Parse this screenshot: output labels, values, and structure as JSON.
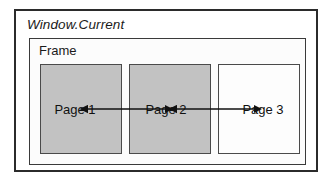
{
  "diagram": {
    "window": {
      "title": "Window.Current",
      "title_style": "italic",
      "border_color": "#2b2b2b",
      "fill_color": "#ffffff"
    },
    "frame": {
      "title": "Frame",
      "border_color": "#3a3a3a",
      "fill_color": "#fcfcfc"
    },
    "pages": [
      {
        "label": "Page 1",
        "fill": "gray",
        "fill_color": "#c2c2c2",
        "border_color": "#4a4a4a"
      },
      {
        "label": "Page 2",
        "fill": "gray",
        "fill_color": "#c2c2c2",
        "border_color": "#4a4a4a"
      },
      {
        "label": "Page 3",
        "fill": "white",
        "fill_color": "#fdfdfd",
        "border_color": "#4a4a4a"
      }
    ],
    "connectors": [
      {
        "name": "page1-page2-connector",
        "from": "Page 1",
        "to": "Page 2",
        "style": "double-headed-arrow",
        "color": "#111111"
      },
      {
        "name": "page2-page3-connector",
        "from": "Page 2",
        "to": "Page 3",
        "style": "double-headed-arrow",
        "color": "#111111"
      }
    ]
  }
}
